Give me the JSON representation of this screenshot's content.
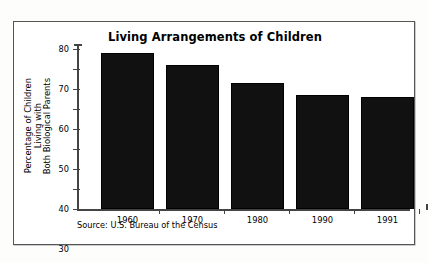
{
  "chart_data": {
    "type": "bar",
    "title": "Living Arrangements of Children",
    "xlabel": "",
    "ylabel": "Percentage of Children Living with Both Biological Parents",
    "ylabel_lines": [
      "Percentage of Children",
      "Living with",
      "Both Biological Parents"
    ],
    "categories": [
      "1960",
      "1970",
      "1980",
      "1990",
      "1991"
    ],
    "values": [
      78,
      72,
      63,
      57,
      56
    ],
    "ylim": [
      0,
      80
    ],
    "ytick_step": 10,
    "yticks": [
      "0",
      "10",
      "20",
      "30",
      "40",
      "50",
      "60",
      "70",
      "80"
    ],
    "grid": false,
    "legend": false,
    "legend_position": "none",
    "bar_color": "#111111",
    "axis_color": "#444444",
    "source_note": "Source: U.S. Bureau of the Census",
    "annotations": []
  },
  "frame": {
    "border_color": "#555555",
    "background": "#ffffff"
  }
}
